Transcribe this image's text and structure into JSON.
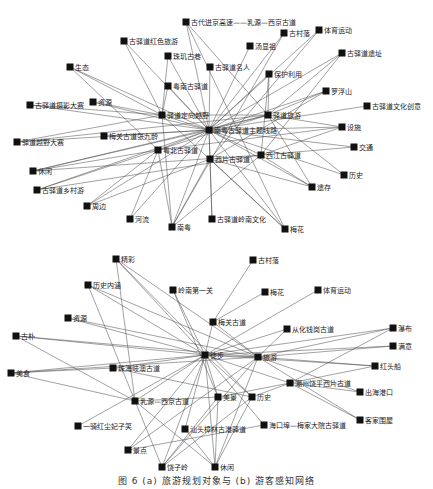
{
  "network_a": {
    "nodes": [
      {
        "id": "a0",
        "label": "古代进京高速——乳源—西京古道"
      },
      {
        "id": "a1",
        "label": "古驿道红色旅游"
      },
      {
        "id": "a2",
        "label": "汤显祖"
      },
      {
        "id": "a3",
        "label": "古村落"
      },
      {
        "id": "a4",
        "label": "体育运动"
      },
      {
        "id": "a5",
        "label": "珠玑古巷"
      },
      {
        "id": "a6",
        "label": "古驿道遗址"
      },
      {
        "id": "a7",
        "label": "生态"
      },
      {
        "id": "a8",
        "label": "古驿道名人"
      },
      {
        "id": "a9",
        "label": "保护利用"
      },
      {
        "id": "a10",
        "label": "粤南古驿道"
      },
      {
        "id": "a11",
        "label": "罗浮山"
      },
      {
        "id": "a12",
        "label": "古驿道摄影大赛"
      },
      {
        "id": "a13",
        "label": "资源"
      },
      {
        "id": "a14",
        "label": "驿道定向越野"
      },
      {
        "id": "a15",
        "label": "驿道旅游"
      },
      {
        "id": "a16",
        "label": "古驿道文化创意"
      },
      {
        "id": "a17",
        "label": "驿道越野大赛"
      },
      {
        "id": "a18",
        "label": "梅关古道张九龄"
      },
      {
        "id": "a19",
        "label": "南粤古驿道主题线路"
      },
      {
        "id": "a20",
        "label": "设施"
      },
      {
        "id": "a21",
        "label": "粤北古驿道"
      },
      {
        "id": "a22",
        "label": "西江古驿道"
      },
      {
        "id": "a23",
        "label": "交通"
      },
      {
        "id": "a24",
        "label": "休闲"
      },
      {
        "id": "a25",
        "label": "西片古驿道"
      },
      {
        "id": "a26",
        "label": "历史"
      },
      {
        "id": "a27",
        "label": "古驿道乡村游"
      },
      {
        "id": "a28",
        "label": "遗存"
      },
      {
        "id": "a29",
        "label": "周边"
      },
      {
        "id": "a30",
        "label": "河流"
      },
      {
        "id": "a31",
        "label": "南粤"
      },
      {
        "id": "a32",
        "label": "古驿道岭南文化"
      },
      {
        "id": "a33",
        "label": "梅花"
      }
    ]
  },
  "network_b": {
    "nodes": [
      {
        "id": "b0",
        "label": "精彩"
      },
      {
        "id": "b1",
        "label": "古村落"
      },
      {
        "id": "b2",
        "label": "历史内涵"
      },
      {
        "id": "b3",
        "label": "岭南第一关"
      },
      {
        "id": "b4",
        "label": "梅花"
      },
      {
        "id": "b5",
        "label": "体育运动"
      },
      {
        "id": "b6",
        "label": "梅关古道"
      },
      {
        "id": "b7",
        "label": "资源"
      },
      {
        "id": "b8",
        "label": "从化钱岗古道"
      },
      {
        "id": "b9",
        "label": "瀑布"
      },
      {
        "id": "b10",
        "label": "古朴"
      },
      {
        "id": "b11",
        "label": "徒步"
      },
      {
        "id": "b12",
        "label": "旅游"
      },
      {
        "id": "b13",
        "label": "满意"
      },
      {
        "id": "b14",
        "label": "珠海岐澳古道"
      },
      {
        "id": "b15",
        "label": "红头船"
      },
      {
        "id": "b16",
        "label": "潮州饶平西片古道"
      },
      {
        "id": "b17",
        "label": "美食"
      },
      {
        "id": "b18",
        "label": "出海港口"
      },
      {
        "id": "b19",
        "label": "乳源—西京古道"
      },
      {
        "id": "b20",
        "label": "美景"
      },
      {
        "id": "b21",
        "label": "历史"
      },
      {
        "id": "b22",
        "label": "客家围屋"
      },
      {
        "id": "b23",
        "label": "一骑红尘妃子笑"
      },
      {
        "id": "b24",
        "label": "汕头樟林古港驿道"
      },
      {
        "id": "b25",
        "label": "海口埠—梅家大院古驿道"
      },
      {
        "id": "b26",
        "label": "景点"
      },
      {
        "id": "b27",
        "label": "饶子岭"
      },
      {
        "id": "b28",
        "label": "休闲"
      }
    ]
  },
  "caption": "图 6  (a) 旅游规划对象与 (b) 游客感知网络"
}
